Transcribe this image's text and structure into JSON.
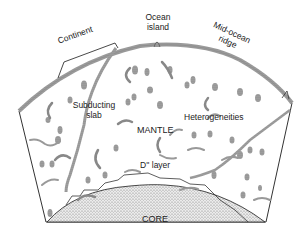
{
  "diagram": {
    "labels": {
      "continent": "Continent",
      "ocean_island_line1": "Ocean",
      "ocean_island_line2": "island",
      "mid_ocean_ridge_line1": "Mid-ocean",
      "mid_ocean_ridge_line2": "ridge",
      "subducting_slab_line1": "Subducting",
      "subducting_slab_line2": "slab",
      "heterogeneities": "Heterogeneities",
      "mantle": "MANTLE",
      "d_layer": "D'' layer",
      "core": "CORE"
    },
    "colors": {
      "outline": "#333333",
      "stipple": "#888888",
      "core_fill": "#d9d9d9",
      "background": "#ffffff"
    }
  }
}
